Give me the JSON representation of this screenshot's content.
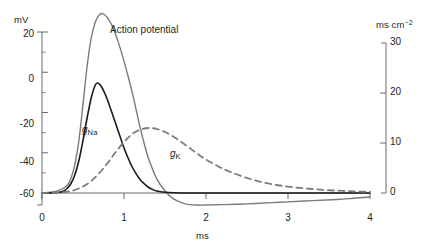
{
  "chart_data": {
    "type": "line",
    "title": "",
    "xlabel": "ms",
    "ylabel_left": "mV",
    "ylabel_right": "ms cm",
    "ylabel_right_exponent": "−2",
    "xlim": [
      0,
      4
    ],
    "ylim_left": [
      -70,
      30
    ],
    "ylim_right": [
      -3,
      33
    ],
    "grid": false,
    "legend": "inline-annotations",
    "xticks": [
      0,
      1,
      2,
      3,
      4
    ],
    "xtick_labels": [
      "0",
      "1",
      "2",
      "3",
      "4"
    ],
    "yticks_left": [
      20,
      0,
      -20,
      -40,
      -60
    ],
    "ytick_labels_left": [
      "20",
      "0",
      "-20",
      "-40",
      "-60"
    ],
    "yticks_left_minor": [
      10,
      -10,
      -30,
      -50,
      -70
    ],
    "yticks_right": [
      0,
      10,
      20,
      30
    ],
    "ytick_labels_right": [
      "0",
      "10",
      "20",
      "30"
    ],
    "series": [
      {
        "name": "Action potential",
        "label": "Action potential",
        "style": "solid",
        "color": "#7b7b7b",
        "axis": "left",
        "units": "mV",
        "resting_potential": -60,
        "peak_value": 29,
        "peak_time_ms": 0.72,
        "undershoot_value": -66,
        "undershoot_time_ms": 1.95,
        "x": [
          0,
          0.1,
          0.2,
          0.3,
          0.35,
          0.4,
          0.45,
          0.5,
          0.55,
          0.6,
          0.65,
          0.7,
          0.75,
          0.8,
          0.85,
          0.9,
          0.95,
          1.0,
          1.05,
          1.1,
          1.15,
          1.2,
          1.25,
          1.3,
          1.4,
          1.5,
          1.6,
          1.7,
          1.8,
          1.9,
          2.0,
          2.2,
          2.5,
          2.8,
          3.0,
          3.3,
          3.6,
          3.8,
          4.0
        ],
        "y": [
          -60,
          -59.6,
          -58.8,
          -56.5,
          -53,
          -46,
          -34,
          -16,
          3,
          17,
          25,
          28.6,
          29,
          27,
          23.5,
          18.5,
          12.5,
          5.5,
          -2,
          -10,
          -19,
          -28,
          -36,
          -43,
          -53,
          -59,
          -62.8,
          -64.8,
          -65.8,
          -66,
          -66,
          -65.8,
          -65.4,
          -64.8,
          -64.4,
          -63.8,
          -63.2,
          -62.6,
          -62
        ]
      },
      {
        "name": "gNa",
        "label": "g",
        "label_subscript": "Na",
        "style": "solid",
        "color": "#1a1a1a",
        "axis": "right",
        "units": "ms cm-2",
        "peak_value": 22,
        "peak_time_ms": 0.68,
        "x": [
          0,
          0.1,
          0.2,
          0.25,
          0.3,
          0.35,
          0.4,
          0.45,
          0.5,
          0.55,
          0.6,
          0.65,
          0.68,
          0.72,
          0.78,
          0.85,
          0.9,
          0.95,
          1.0,
          1.05,
          1.1,
          1.15,
          1.2,
          1.25,
          1.3,
          1.35,
          1.4,
          1.5,
          1.6,
          1.8,
          2.0,
          2.5,
          3.0,
          3.5,
          4.0
        ],
        "y": [
          0,
          0,
          0.1,
          0.3,
          0.8,
          1.8,
          3.6,
          6.5,
          10.5,
          15,
          19,
          21.6,
          22,
          21.4,
          19.4,
          16.2,
          13.8,
          11.4,
          9,
          7,
          5.2,
          3.8,
          2.6,
          1.8,
          1.1,
          0.7,
          0.4,
          0.15,
          0.05,
          0,
          0,
          0,
          0,
          0,
          0
        ]
      },
      {
        "name": "gK",
        "label": "g",
        "label_subscript": "K",
        "style": "dashed",
        "color": "#7b7b7b",
        "axis": "right",
        "units": "ms cm-2",
        "peak_value": 13,
        "peak_time_ms": 1.3,
        "x": [
          0,
          0.15,
          0.3,
          0.4,
          0.5,
          0.6,
          0.7,
          0.8,
          0.9,
          1.0,
          1.1,
          1.2,
          1.3,
          1.4,
          1.5,
          1.6,
          1.7,
          1.8,
          1.9,
          2.0,
          2.15,
          2.3,
          2.5,
          2.7,
          2.9,
          3.1,
          3.3,
          3.5,
          3.7,
          3.85,
          4.0
        ],
        "y": [
          0,
          0.05,
          0.25,
          0.6,
          1.3,
          2.4,
          4.0,
          6.0,
          8.2,
          10.2,
          11.8,
          12.7,
          13,
          12.8,
          12.2,
          11.3,
          10.2,
          9.0,
          7.8,
          6.7,
          5.3,
          4.2,
          3.0,
          2.1,
          1.5,
          1.1,
          0.8,
          0.55,
          0.4,
          0.3,
          0.25
        ]
      }
    ],
    "annotations": [
      {
        "text": "Action potential",
        "x_ms": 1.05,
        "value": 22,
        "name": "action-potential-label"
      },
      {
        "text": "gNa",
        "x_ms": 0.55,
        "value": 9,
        "name": "gna-label"
      },
      {
        "text": "gK",
        "x_ms": 1.6,
        "value": 6.5,
        "name": "gk-label"
      }
    ]
  },
  "axes": {
    "left": {
      "unit": "mV",
      "ticks": [
        "20",
        "0",
        "-20",
        "-40",
        "-60"
      ]
    },
    "right": {
      "unit_base": "ms cm",
      "unit_exponent": "−2",
      "ticks": [
        "30",
        "20",
        "10",
        "0"
      ]
    },
    "bottom": {
      "unit": "ms",
      "ticks": [
        "0",
        "1",
        "2",
        "3",
        "4"
      ]
    }
  },
  "colors": {
    "action_potential": "#7b7b7b",
    "gna": "#1a1a1a",
    "gk": "#7b7b7b",
    "axis": "#58595b",
    "text": "#231f20",
    "background": "#ffffff"
  }
}
